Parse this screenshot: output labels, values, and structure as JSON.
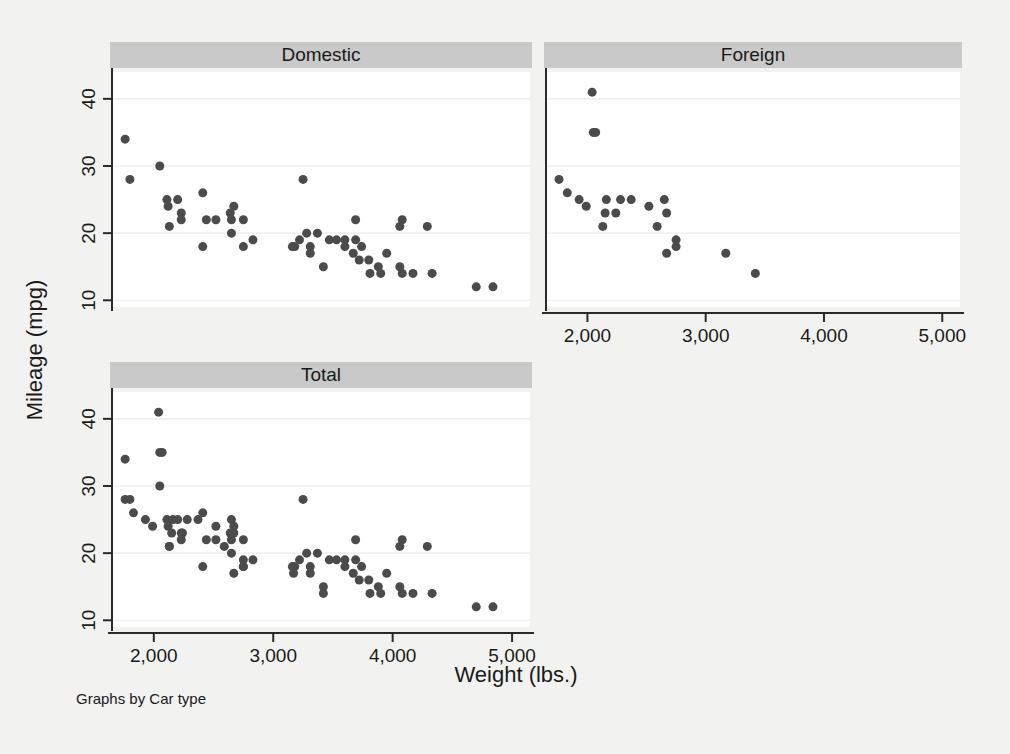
{
  "figure": {
    "note": "Graphs by Car type",
    "background_color": "#f2f2f0",
    "panel_background_color": "#ffffff",
    "title_bar_color": "#c9c9c9",
    "marker_color": "#4b4b4b",
    "gridline_color": "#eceaea"
  },
  "panels": {
    "domestic": {
      "title": "Domestic"
    },
    "foreign": {
      "title": "Foreign"
    },
    "total": {
      "title": "Total"
    }
  },
  "axes": {
    "x_title": "Weight (lbs.)",
    "y_title": "Mileage (mpg)",
    "x_ticks": [
      "2,000",
      "3,000",
      "4,000",
      "5,000"
    ],
    "y_ticks": [
      "10",
      "20",
      "30",
      "40"
    ]
  },
  "chart_data": {
    "type": "scatter",
    "title": "",
    "subtitle": "",
    "xlabel": "Weight (lbs.)",
    "ylabel": "Mileage (mpg)",
    "note": "Graphs by Car type",
    "grid": "horizontal",
    "legend": "none",
    "layout": "3 panels: Domestic (top-left), Foreign (top-right), Total (bottom-left)",
    "xlim": [
      1650,
      5150
    ],
    "ylim": [
      9,
      44
    ],
    "x_ticks": [
      2000,
      3000,
      4000,
      5000
    ],
    "x_tick_labels": [
      "2,000",
      "3,000",
      "4,000",
      "5,000"
    ],
    "y_ticks": [
      10,
      20,
      30,
      40
    ],
    "y_tick_labels": [
      "10",
      "20",
      "30",
      "40"
    ],
    "marker": {
      "shape": "circle",
      "color": "#4b4b4b",
      "size": 9
    },
    "panels": [
      {
        "name": "Domestic",
        "n": 52,
        "points": [
          [
            4080,
            22
          ],
          [
            3670,
            17
          ],
          [
            3690,
            22
          ],
          [
            3280,
            20
          ],
          [
            3880,
            15
          ],
          [
            4330,
            14
          ],
          [
            3900,
            14
          ],
          [
            4290,
            21
          ],
          [
            2110,
            25
          ],
          [
            2200,
            25
          ],
          [
            2670,
            24
          ],
          [
            3690,
            19
          ],
          [
            3180,
            18
          ],
          [
            3220,
            19
          ],
          [
            4060,
            15
          ],
          [
            3600,
            18
          ],
          [
            3600,
            19
          ],
          [
            3740,
            18
          ],
          [
            3470,
            19
          ],
          [
            2830,
            19
          ],
          [
            2120,
            24
          ],
          [
            2750,
            18
          ],
          [
            3310,
            17
          ],
          [
            3310,
            18
          ],
          [
            4080,
            14
          ],
          [
            4060,
            21
          ],
          [
            4840,
            12
          ],
          [
            2230,
            23
          ],
          [
            2750,
            22
          ],
          [
            2650,
            20
          ],
          [
            2640,
            23
          ],
          [
            2440,
            22
          ],
          [
            3370,
            20
          ],
          [
            3800,
            16
          ],
          [
            3720,
            16
          ],
          [
            3530,
            19
          ],
          [
            2130,
            21
          ],
          [
            2650,
            22
          ],
          [
            2410,
            18
          ],
          [
            2230,
            22
          ],
          [
            3160,
            18
          ],
          [
            3250,
            28
          ],
          [
            3950,
            17
          ],
          [
            4170,
            14
          ],
          [
            4700,
            12
          ],
          [
            1800,
            28
          ],
          [
            1760,
            34
          ],
          [
            2050,
            30
          ],
          [
            2410,
            26
          ],
          [
            2520,
            22
          ],
          [
            3420,
            15
          ],
          [
            3810,
            14
          ]
        ]
      },
      {
        "name": "Foreign",
        "n": 22,
        "points": [
          [
            2070,
            35
          ],
          [
            2750,
            18
          ],
          [
            2240,
            23
          ],
          [
            2520,
            24
          ],
          [
            2160,
            25
          ],
          [
            2670,
            23
          ],
          [
            2370,
            25
          ],
          [
            2130,
            21
          ],
          [
            2650,
            25
          ],
          [
            1760,
            28
          ],
          [
            3170,
            17
          ],
          [
            2590,
            21
          ],
          [
            2280,
            25
          ],
          [
            2750,
            19
          ],
          [
            3420,
            14
          ],
          [
            2050,
            35
          ],
          [
            1930,
            25
          ],
          [
            1990,
            24
          ],
          [
            2150,
            23
          ],
          [
            2670,
            17
          ],
          [
            1830,
            26
          ],
          [
            2040,
            41
          ]
        ]
      },
      {
        "name": "Total",
        "n": 74,
        "points": [
          [
            4080,
            22
          ],
          [
            3670,
            17
          ],
          [
            3690,
            22
          ],
          [
            3280,
            20
          ],
          [
            3880,
            15
          ],
          [
            4330,
            14
          ],
          [
            3900,
            14
          ],
          [
            4290,
            21
          ],
          [
            2110,
            25
          ],
          [
            2200,
            25
          ],
          [
            2670,
            24
          ],
          [
            3690,
            19
          ],
          [
            3180,
            18
          ],
          [
            3220,
            19
          ],
          [
            4060,
            15
          ],
          [
            3600,
            18
          ],
          [
            3600,
            19
          ],
          [
            3740,
            18
          ],
          [
            3470,
            19
          ],
          [
            2830,
            19
          ],
          [
            2120,
            24
          ],
          [
            2750,
            18
          ],
          [
            3310,
            17
          ],
          [
            3310,
            18
          ],
          [
            4080,
            14
          ],
          [
            4060,
            21
          ],
          [
            4840,
            12
          ],
          [
            2230,
            23
          ],
          [
            2750,
            22
          ],
          [
            2650,
            20
          ],
          [
            2640,
            23
          ],
          [
            2440,
            22
          ],
          [
            3370,
            20
          ],
          [
            3800,
            16
          ],
          [
            3720,
            16
          ],
          [
            3530,
            19
          ],
          [
            2130,
            21
          ],
          [
            2650,
            22
          ],
          [
            2410,
            18
          ],
          [
            2230,
            22
          ],
          [
            3160,
            18
          ],
          [
            3250,
            28
          ],
          [
            3950,
            17
          ],
          [
            4170,
            14
          ],
          [
            4700,
            12
          ],
          [
            1800,
            28
          ],
          [
            1760,
            34
          ],
          [
            2050,
            30
          ],
          [
            2410,
            26
          ],
          [
            2520,
            22
          ],
          [
            3420,
            15
          ],
          [
            3810,
            14
          ],
          [
            2070,
            35
          ],
          [
            2750,
            18
          ],
          [
            2240,
            23
          ],
          [
            2520,
            24
          ],
          [
            2160,
            25
          ],
          [
            2670,
            23
          ],
          [
            2370,
            25
          ],
          [
            2130,
            21
          ],
          [
            2650,
            25
          ],
          [
            1760,
            28
          ],
          [
            3170,
            17
          ],
          [
            2590,
            21
          ],
          [
            2280,
            25
          ],
          [
            2750,
            19
          ],
          [
            3420,
            14
          ],
          [
            2050,
            35
          ],
          [
            1930,
            25
          ],
          [
            1990,
            24
          ],
          [
            2150,
            23
          ],
          [
            2670,
            17
          ],
          [
            1830,
            26
          ],
          [
            2040,
            41
          ]
        ]
      }
    ]
  }
}
